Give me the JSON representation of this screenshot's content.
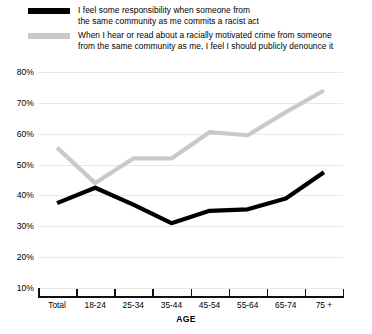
{
  "legend": {
    "items": [
      {
        "label": "I feel some responsibility when someone from\nthe same community as me commits a racist act",
        "color": "#000000",
        "swatch_name": "legend-swatch-responsibility"
      },
      {
        "label": "When I hear or read about a racially motivated crime from someone\nfrom the same community as me, I feel I should publicly denounce it",
        "color": "#c9c9c9",
        "swatch_name": "legend-swatch-denounce"
      }
    ]
  },
  "axis": {
    "x_title": "AGE",
    "y_ticks": [
      "80%",
      "70%",
      "60%",
      "50%",
      "40%",
      "30%",
      "20%",
      "10%"
    ]
  },
  "chart_data": {
    "type": "line",
    "title": "",
    "subtitle": "",
    "xlabel": "AGE",
    "ylabel": "",
    "ylim": [
      0,
      80
    ],
    "yticks": [
      10,
      20,
      30,
      40,
      50,
      60,
      70,
      80
    ],
    "ytick_labels": [
      "10%",
      "20%",
      "30%",
      "40%",
      "50%",
      "60%",
      "70%",
      "80%"
    ],
    "grid": true,
    "legend_position": "top-left",
    "categories": [
      "Total",
      "18-24",
      "25-34",
      "35-44",
      "45-54",
      "55-64",
      "65-74",
      "75 +"
    ],
    "series": [
      {
        "name": "I feel some responsibility when someone from the same community as me commits a racist act",
        "color": "#000000",
        "values": [
          37.5,
          42.5,
          37,
          31,
          35,
          35.5,
          39,
          47.5
        ]
      },
      {
        "name": "When I hear or read about a racially motivated crime from someone from the same community as me, I feel I should publicly denounce it",
        "color": "#c9c9c9",
        "values": [
          55.5,
          44,
          52,
          52,
          60.5,
          59.5,
          67,
          74
        ]
      }
    ]
  }
}
